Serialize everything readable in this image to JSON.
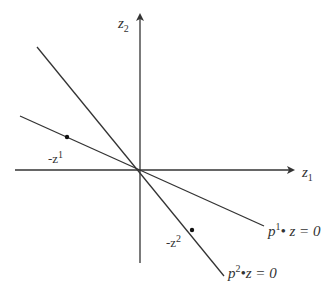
{
  "diagram": {
    "axes": {
      "x_label": "z",
      "x_label_sub": "1",
      "y_label": "z",
      "y_label_sub": "2"
    },
    "lines": [
      {
        "name": "p1-hyperplane",
        "label_base": "p",
        "label_sup": "1",
        "label_rest": "• z = 0"
      },
      {
        "name": "p2-hyperplane",
        "label_base": "p",
        "label_sup": "2",
        "label_rest": "•z = 0"
      }
    ],
    "points": [
      {
        "name": "neg-z1",
        "label_prefix": "-z",
        "label_sup": "1"
      },
      {
        "name": "neg-z2",
        "label_prefix": "-z",
        "label_sup": "2"
      }
    ],
    "colors": {
      "stroke": "#333333",
      "background": "#ffffff"
    }
  }
}
